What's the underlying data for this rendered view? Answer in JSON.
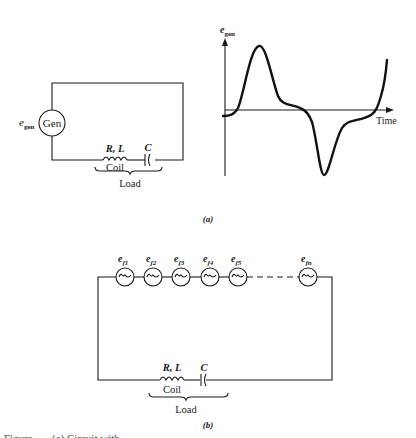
{
  "figure_a": {
    "label": "(a)",
    "circuit": {
      "source_symbol": "e",
      "source_subscript": "gen",
      "generator_label": "Gen",
      "coil_params": "R, L",
      "capacitor_label": "C",
      "coil_label": "Coil",
      "load_label": "Load"
    },
    "waveform": {
      "y_axis_symbol": "e",
      "y_axis_subscript": "gen",
      "x_axis_label": "Time",
      "description": "Non-sinusoidal periodic wave: large positive peak, shoulder near zero, large negative trough, rising again"
    }
  },
  "figure_b": {
    "label": "(b)",
    "sources": [
      {
        "symbol": "e",
        "subscript": "f1"
      },
      {
        "symbol": "e",
        "subscript": "f2"
      },
      {
        "symbol": "e",
        "subscript": "f3"
      },
      {
        "symbol": "e",
        "subscript": "f4"
      },
      {
        "symbol": "e",
        "subscript": "f5"
      },
      {
        "symbol": "e",
        "subscript": "fn"
      }
    ],
    "source_glyph": "~",
    "coil_params": "R, L",
    "capacitor_label": "C",
    "coil_label": "Coil",
    "load_label": "Load"
  },
  "caption_partial": "Figure . . . (a) Circuit with . . ."
}
